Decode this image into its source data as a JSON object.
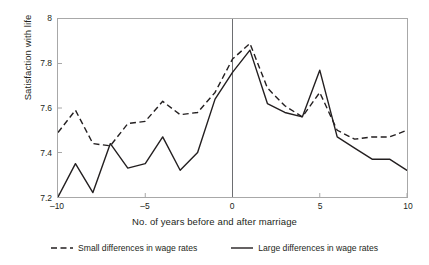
{
  "chart_data": {
    "type": "line",
    "title": "",
    "xlabel": "No. of years before and after marriage",
    "ylabel": "Satisfaction with life",
    "xlim": [
      -10,
      10
    ],
    "ylim": [
      7.2,
      8.0
    ],
    "xticks": [
      -10,
      -5,
      0,
      5,
      10
    ],
    "xticklabels": [
      "–10",
      "–5",
      "0",
      "5",
      "10"
    ],
    "yticks": [
      7.2,
      7.4,
      7.6,
      7.8,
      8.0
    ],
    "yticklabels": [
      "7.2",
      "7.4",
      "7.6",
      "7.8",
      "8"
    ],
    "grid": false,
    "legend_position": "below",
    "annotations": [
      {
        "type": "vline",
        "x": 0,
        "label": "year of marriage"
      }
    ],
    "x": [
      -10,
      -9,
      -8,
      -7,
      -6,
      -5,
      -4,
      -3,
      -2,
      -1,
      0,
      1,
      2,
      3,
      4,
      5,
      6,
      7,
      8,
      9,
      10
    ],
    "series": [
      {
        "name": "Small differences in wage rates",
        "style": "dashed",
        "color": "#231f20",
        "values": [
          7.49,
          7.59,
          7.44,
          7.43,
          7.53,
          7.54,
          7.63,
          7.57,
          7.58,
          7.67,
          7.82,
          7.89,
          7.69,
          7.61,
          7.56,
          7.67,
          7.5,
          7.46,
          7.47,
          7.47,
          7.5
        ]
      },
      {
        "name": "Large differences in wage rates",
        "style": "solid",
        "color": "#231f20",
        "values": [
          7.2,
          7.35,
          7.22,
          7.44,
          7.33,
          7.35,
          7.47,
          7.32,
          7.4,
          7.64,
          7.76,
          7.86,
          7.62,
          7.58,
          7.56,
          7.77,
          7.47,
          7.42,
          7.37,
          7.37,
          7.32
        ]
      }
    ]
  },
  "legend": {
    "items": [
      {
        "label": "Small differences in wage rates",
        "style": "dashed"
      },
      {
        "label": "Large differences in wage rates",
        "style": "solid"
      }
    ]
  }
}
